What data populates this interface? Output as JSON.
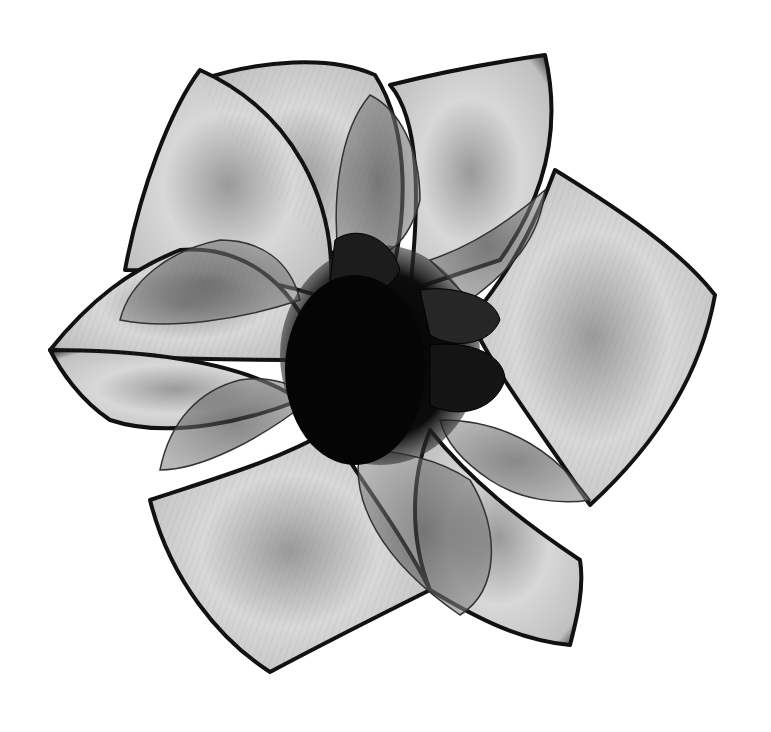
{
  "image": {
    "subject": "X-ray style grayscale photograph of a flower with overlapping translucent petals",
    "alt": "Grayscale translucent flower, top view, dark center",
    "background_color": "#ffffff",
    "palette": {
      "petal_light": "#e6e6e6",
      "petal_mid": "#b4b4b4",
      "petal_edge": "#1a1a1a",
      "inner_petal": "#6e6e6e",
      "center": "#080808"
    },
    "petal_count_outer": 6,
    "petal_count_inner": 6
  }
}
